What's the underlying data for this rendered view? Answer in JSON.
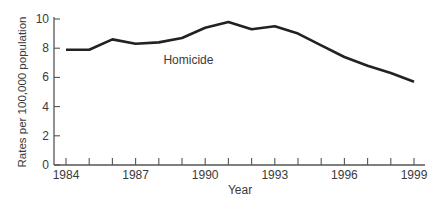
{
  "chart_data": {
    "type": "line",
    "title": "",
    "xlabel": "Year",
    "ylabel": "Rates per 100,000 population",
    "x": [
      1984,
      1985,
      1986,
      1987,
      1988,
      1989,
      1990,
      1991,
      1992,
      1993,
      1994,
      1995,
      1996,
      1997,
      1998,
      1999
    ],
    "xticks_labeled": [
      "1984",
      "1987",
      "1990",
      "1993",
      "1996",
      "1999"
    ],
    "yticks": [
      "0",
      "2",
      "4",
      "6",
      "8",
      "10"
    ],
    "ylim": [
      0,
      10
    ],
    "xlim": [
      1984,
      1999
    ],
    "grid": false,
    "series": [
      {
        "name": "Homicide",
        "values": [
          7.9,
          7.9,
          8.6,
          8.3,
          8.4,
          8.7,
          9.4,
          9.8,
          9.3,
          9.5,
          9.0,
          8.2,
          7.4,
          6.8,
          6.3,
          5.7
        ],
        "color": "#222222"
      }
    ],
    "annotations": [
      {
        "text": "Homicide",
        "x": 1988.2,
        "y": 7.9
      }
    ],
    "legend": "none (inline label)"
  }
}
